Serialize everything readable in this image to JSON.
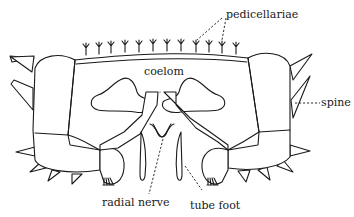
{
  "figure": {
    "labels": {
      "pedicellariae": "pedicellariae",
      "coelom": "coelom",
      "spine": "spine",
      "radial_nerve": "radial nerve",
      "tube_foot": "tube foot"
    },
    "colors": {
      "line": "#1a1a1a",
      "background": "#ffffff"
    }
  }
}
